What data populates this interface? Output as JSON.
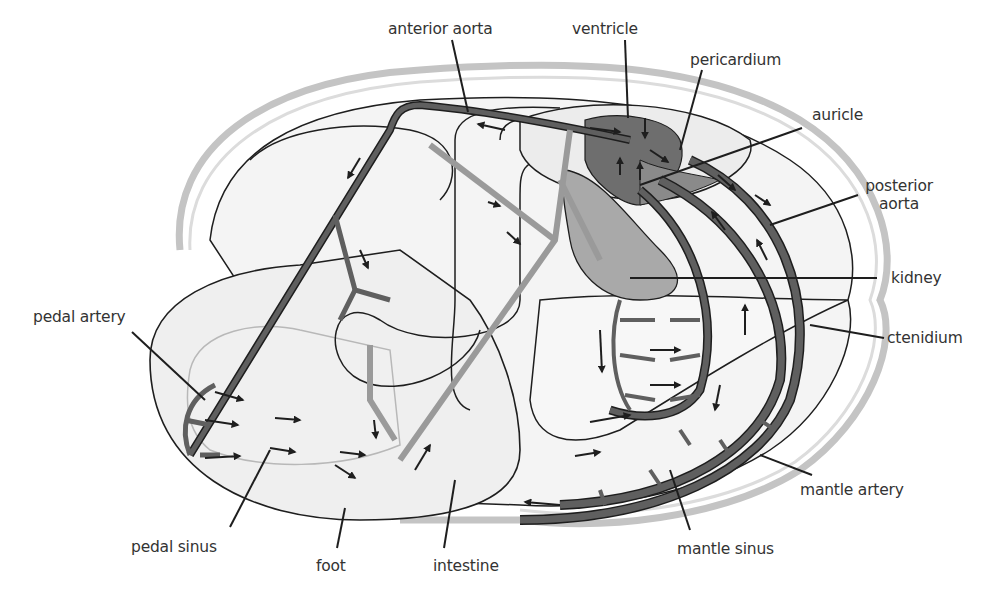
{
  "diagram": {
    "colors": {
      "background": "#ffffff",
      "shell_outline": "#c4c4c4",
      "body_fill": "#f1f1f1",
      "outline": "#1e1e1e",
      "artery": "#5f5f5f",
      "vein": "#9a9a9a",
      "heart": "#6e6e6e",
      "kidney": "#a9a9a9",
      "arrow": "#1e1e1e",
      "label_text": "#333333"
    },
    "labels": {
      "anterior_aorta": "anterior aorta",
      "ventricle": "ventricle",
      "pericardium": "pericardium",
      "auricle": "auricle",
      "posterior_aorta_line1": "posterior",
      "posterior_aorta_line2": "aorta",
      "kidney": "kidney",
      "ctenidium": "ctenidium",
      "pedal_artery": "pedal artery",
      "mantle_artery": "mantle artery",
      "pedal_sinus": "pedal sinus",
      "foot": "foot",
      "intestine": "intestine",
      "mantle_sinus": "mantle sinus"
    }
  }
}
